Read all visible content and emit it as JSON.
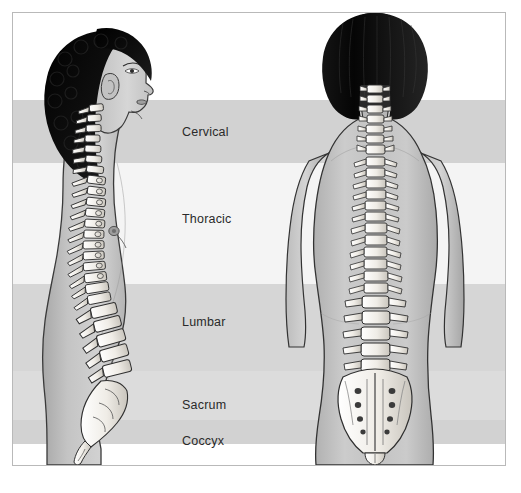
{
  "illustration": {
    "title": "Regions of the Vertebral Column",
    "description": "Lateral (left) and posterior (right) views of a human figure with the vertebral column visible, divided into labeled spinal regions.",
    "border_color": "#b9b9b9",
    "background_color": "#ffffff"
  },
  "figures": [
    {
      "id": "lateral-figure",
      "name": "lateral-view-figure",
      "view": "lateral",
      "facing": "right",
      "hair_color": "#0d0d0d",
      "skin_color": "#c9c9c9",
      "bone_color": "#f2f0ec"
    },
    {
      "id": "posterior-figure",
      "name": "posterior-view-figure",
      "view": "posterior",
      "facing": "away",
      "hair_color": "#111111",
      "skin_color": "#bdbdbd",
      "bone_color": "#efeeea"
    }
  ],
  "regions": [
    {
      "label": "Cervical",
      "band_color": "#d2d2d2",
      "label_x": 182,
      "label_y": 132,
      "band_top": 100,
      "band_bottom": 163,
      "vertebrae_count": 7
    },
    {
      "label": "Thoracic",
      "band_color": "#f4f4f4",
      "label_x": 182,
      "label_y": 219,
      "band_top": 163,
      "band_bottom": 284,
      "vertebrae_count": 12
    },
    {
      "label": "Lumbar",
      "band_color": "#d6d6d6",
      "label_x": 182,
      "label_y": 322,
      "band_top": 284,
      "band_bottom": 371,
      "vertebrae_count": 5
    },
    {
      "label": "Sacrum",
      "band_color": "#dcdcdc",
      "label_x": 182,
      "label_y": 405,
      "band_top": 371,
      "band_bottom": 420,
      "vertebrae_count": 5
    },
    {
      "label": "Coccyx",
      "band_color": "#d2d2d2",
      "label_x": 182,
      "label_y": 441,
      "band_top": 420,
      "band_bottom": 444,
      "vertebrae_count": 4
    }
  ]
}
